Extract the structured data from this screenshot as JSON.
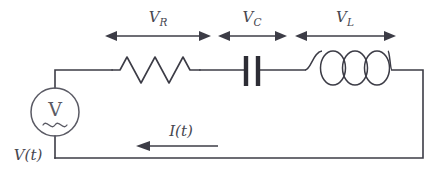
{
  "figure": {
    "type": "circuit-diagram",
    "background_color": "#ffffff",
    "line_color": "#3c3c46"
  },
  "labels": {
    "resistor_voltage": "V",
    "resistor_voltage_sub": "R",
    "capacitor_voltage": "V",
    "capacitor_voltage_sub": "C",
    "inductor_voltage": "V",
    "inductor_voltage_sub": "L",
    "current": "I(t)",
    "source_voltage": "V(t)",
    "source_symbol": "V"
  },
  "components": [
    {
      "name": "voltage-source",
      "kind": "ac-source",
      "symbol": "V",
      "glyph": "sine-wave",
      "label": "V(t)"
    },
    {
      "name": "resistor",
      "kind": "resistor",
      "symbol": "zigzag",
      "voltage_label": "V_R"
    },
    {
      "name": "capacitor",
      "kind": "capacitor",
      "symbol": "parallel-plates",
      "plates": 2,
      "voltage_label": "V_C"
    },
    {
      "name": "inductor",
      "kind": "inductor",
      "symbol": "coil",
      "loops": 3,
      "voltage_label": "V_L"
    }
  ],
  "annotations": {
    "current_direction": "leftward",
    "span_markers": [
      {
        "for": "resistor",
        "style": "double-headed-arrow"
      },
      {
        "for": "capacitor",
        "style": "double-headed-arrow"
      },
      {
        "for": "inductor",
        "style": "double-headed-arrow"
      }
    ]
  }
}
